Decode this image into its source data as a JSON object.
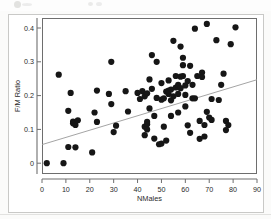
{
  "chart_data": {
    "type": "scatter",
    "title": "",
    "xlabel": "NMales",
    "ylabel": "F/M Ratio",
    "xlim": [
      0,
      90
    ],
    "ylim": [
      -0.03,
      0.44
    ],
    "xticks": [
      0,
      10,
      20,
      30,
      40,
      50,
      60,
      70,
      80,
      90
    ],
    "xtick_labels": [
      "0",
      "10",
      "20",
      "30",
      "40",
      "50",
      "60",
      "70",
      "80",
      "90"
    ],
    "yticks": [
      0,
      0.1,
      0.2,
      0.3,
      0.4
    ],
    "ytick_labels": [
      "0",
      "0.1",
      "0.2",
      "0.3",
      "0.4"
    ],
    "grid": false,
    "legend": null,
    "marker_color": "#161616",
    "marker_size": 3.1,
    "fit_line": {
      "type": "linear-regression",
      "color": "#9a9a9a",
      "x_start": 0,
      "y_start": 0.055,
      "x_end": 90,
      "y_end": 0.247
    },
    "points": [
      [
        2,
        0.0
      ],
      [
        9,
        0.0
      ],
      [
        7,
        0.262
      ],
      [
        11,
        0.155
      ],
      [
        11,
        0.048
      ],
      [
        12,
        0.208
      ],
      [
        13,
        0.123
      ],
      [
        13,
        0.118
      ],
      [
        14,
        0.113
      ],
      [
        14,
        0.047
      ],
      [
        15,
        0.127
      ],
      [
        21,
        0.032
      ],
      [
        22,
        0.15
      ],
      [
        23,
        0.215
      ],
      [
        23,
        0.122
      ],
      [
        28,
        0.205
      ],
      [
        29,
        0.3
      ],
      [
        29,
        0.175
      ],
      [
        30,
        0.092
      ],
      [
        31,
        0.111
      ],
      [
        35,
        0.213
      ],
      [
        36,
        0.153
      ],
      [
        40,
        0.208
      ],
      [
        41,
        0.19
      ],
      [
        42,
        0.213
      ],
      [
        43,
        0.083
      ],
      [
        43,
        0.198
      ],
      [
        43,
        0.108
      ],
      [
        44,
        0.115
      ],
      [
        44,
        0.1
      ],
      [
        44,
        0.122
      ],
      [
        44,
        0.207
      ],
      [
        45,
        0.162
      ],
      [
        45,
        0.248
      ],
      [
        46,
        0.22
      ],
      [
        46,
        0.32
      ],
      [
        47,
        0.073
      ],
      [
        47,
        0.14
      ],
      [
        48,
        0.193
      ],
      [
        48,
        0.3
      ],
      [
        49,
        0.056
      ],
      [
        50,
        0.058
      ],
      [
        50,
        0.188
      ],
      [
        50,
        0.237
      ],
      [
        51,
        0.192
      ],
      [
        51,
        0.108
      ],
      [
        52,
        0.067
      ],
      [
        52,
        0.212
      ],
      [
        53,
        0.205
      ],
      [
        53,
        0.215
      ],
      [
        53,
        0.245
      ],
      [
        54,
        0.186
      ],
      [
        54,
        0.218
      ],
      [
        54,
        0.14
      ],
      [
        55,
        0.198
      ],
      [
        55,
        0.362
      ],
      [
        56,
        0.224
      ],
      [
        56,
        0.258
      ],
      [
        57,
        0.205
      ],
      [
        57,
        0.232
      ],
      [
        57,
        0.15
      ],
      [
        58,
        0.256
      ],
      [
        58,
        0.222
      ],
      [
        58,
        0.345
      ],
      [
        59,
        0.258
      ],
      [
        59,
        0.29
      ],
      [
        59,
        0.312
      ],
      [
        60,
        0.23
      ],
      [
        60,
        0.202
      ],
      [
        60,
        0.168
      ],
      [
        61,
        0.112
      ],
      [
        61,
        0.243
      ],
      [
        62,
        0.09
      ],
      [
        62,
        0.288
      ],
      [
        63,
        0.232
      ],
      [
        63,
        0.192
      ],
      [
        64,
        0.398
      ],
      [
        64,
        0.192
      ],
      [
        65,
        0.258
      ],
      [
        66,
        0.072
      ],
      [
        66,
        0.125
      ],
      [
        67,
        0.268
      ],
      [
        67,
        0.255
      ],
      [
        68,
        0.113
      ],
      [
        68,
        0.079
      ],
      [
        69,
        0.412
      ],
      [
        69,
        0.152
      ],
      [
        70,
        0.135
      ],
      [
        71,
        0.19
      ],
      [
        71,
        0.128
      ],
      [
        73,
        0.364
      ],
      [
        74,
        0.187
      ],
      [
        75,
        0.232
      ],
      [
        76,
        0.265
      ],
      [
        77,
        0.125
      ],
      [
        77,
        0.098
      ],
      [
        78,
        0.113
      ],
      [
        79,
        0.352
      ],
      [
        81,
        0.402
      ]
    ]
  },
  "axes": {
    "x_title": "NMales",
    "y_title": "F/M Ratio"
  }
}
